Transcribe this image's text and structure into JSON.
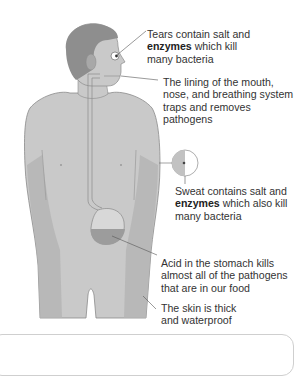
{
  "diagram": {
    "topic": "Body defences against pathogens",
    "labels": [
      {
        "id": "tears",
        "bold": "",
        "line1": "Tears contain salt and",
        "line2_bold": "enzymes",
        "line2_rest": " which kill",
        "line3": "many bacteria"
      },
      {
        "id": "lining",
        "line1": "The lining of the mouth,",
        "line2": "nose, and breathing system",
        "line3": "traps and removes",
        "line4": "pathogens"
      },
      {
        "id": "sweat",
        "line1": "Sweat contains salt and",
        "line2_bold": "enzymes",
        "line2_rest": " which also kill",
        "line3": "many bacteria"
      },
      {
        "id": "acid",
        "line1": "Acid in the stomach kills",
        "line2": "almost all of the pathogens",
        "line3": "that are in our food"
      },
      {
        "id": "skin",
        "line1": "The skin is thick",
        "line2": "and waterproof"
      }
    ],
    "colors": {
      "skin": "#c8c8c8",
      "skin_shadow": "#b2b2b2",
      "hair": "#8a8a8a",
      "stomach_acid": "#9c9c9c",
      "leader_line": "#555555",
      "text": "#333333"
    }
  }
}
